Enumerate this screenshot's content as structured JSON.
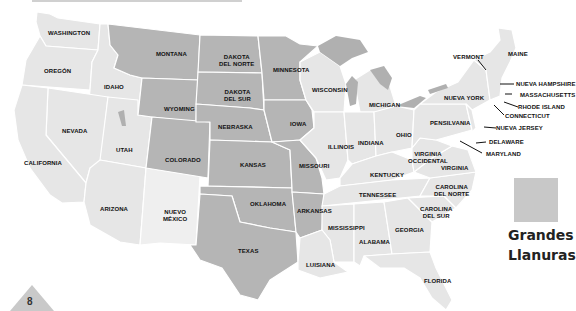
{
  "colors": {
    "plains": "#b5b5b5",
    "other": "#e6e6e6",
    "light": "#efefef",
    "lakes": "#b0b0b0",
    "legend_swatch": "#c8c8c8"
  },
  "legend": {
    "label_line1": "Grandes",
    "label_line2": "Llanuras"
  },
  "page": {
    "number": "8"
  },
  "states": {
    "washington": "WASHINGTON",
    "oregon": "OREGÓN",
    "idaho": "IDAHO",
    "montana": "MONTANA",
    "nevada": "NEVADA",
    "california": "CALIFORNIA",
    "utah": "UTAH",
    "wyoming": "WYOMING",
    "colorado": "COLORADO",
    "arizona": "ARIZONA",
    "new_mexico_1": "NUEVO",
    "new_mexico_2": "MÉXICO",
    "north_dakota_1": "DAKOTA",
    "north_dakota_2": "DEL NORTE",
    "south_dakota_1": "DAKOTA",
    "south_dakota_2": "DEL SUR",
    "nebraska": "NEBRASKA",
    "kansas": "KANSAS",
    "oklahoma": "OKLAHOMA",
    "texas": "TEXAS",
    "minnesota": "MINNESOTA",
    "iowa": "IOWA",
    "missouri": "MISSOURI",
    "arkansas": "ARKANSAS",
    "louisiana": "LUISIANA",
    "wisconsin": "WISCONSIN",
    "illinois": "ILLINOIS",
    "michigan": "MICHIGAN",
    "indiana": "INDIANA",
    "ohio": "OHIO",
    "kentucky": "KENTUCKY",
    "tennessee": "TENNESSEE",
    "mississippi": "MISSISSIPPI",
    "alabama": "ALABAMA",
    "georgia": "GEORGIA",
    "florida": "FLORIDA",
    "south_carolina_1": "CAROLINA",
    "south_carolina_2": "DEL SUR",
    "north_carolina_1": "CAROLINA",
    "north_carolina_2": "DEL NORTE",
    "virginia": "VIRGINIA",
    "west_virginia_1": "VIRGINIA",
    "west_virginia_2": "OCCIDENTAL",
    "pennsylvania": "PENSILVANIA",
    "new_york": "NUEVA YORK",
    "vermont": "VERMONT",
    "maine": "MAINE",
    "new_hampshire": "NUEVA HAMPSHIRE",
    "massachusetts": "MASSACHUSETTS",
    "rhode_island": "RHODE ISLAND",
    "connecticut": "CONNECTICUT",
    "new_jersey": "NUEVA JERSEY",
    "delaware": "DELAWARE",
    "maryland": "MARYLAND"
  }
}
